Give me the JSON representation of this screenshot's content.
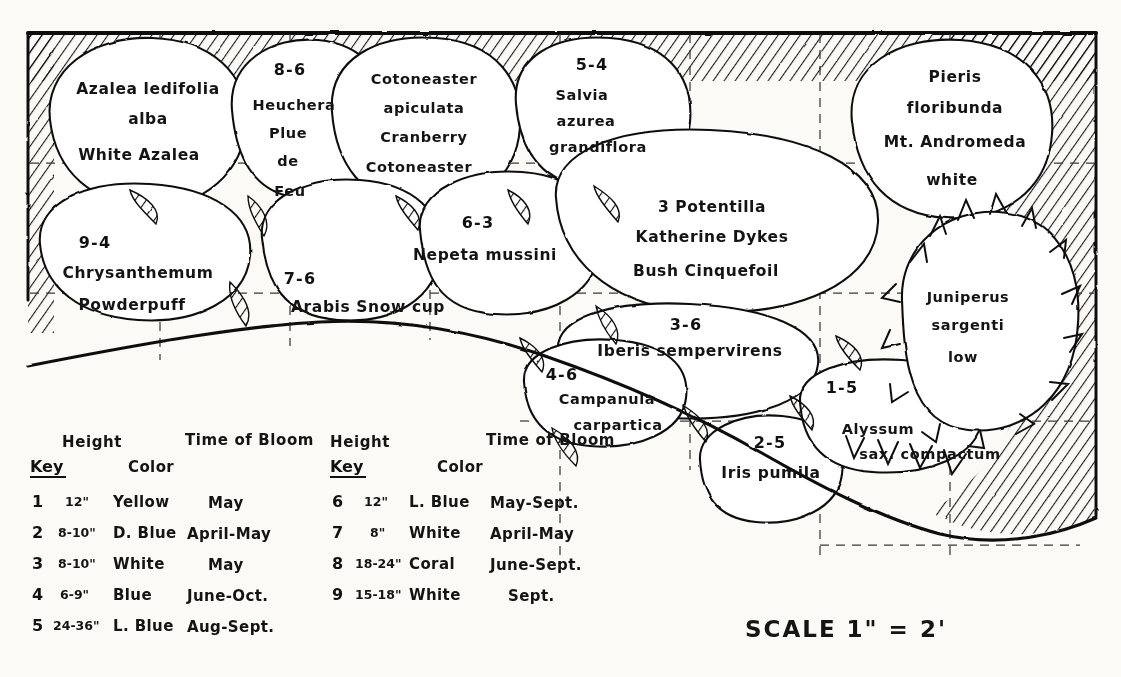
{
  "document": {
    "title": "Garden Planting Plan",
    "scale_text": "SCALE 1\" = 2'"
  },
  "plants": [
    {
      "id": "azalea",
      "key": "",
      "lines": [
        "Azalea ledifolia",
        "alba",
        "White Azalea"
      ]
    },
    {
      "id": "heuchera",
      "key": "8-6",
      "lines": [
        "Heuchera",
        "Plue",
        "de",
        "Feu"
      ]
    },
    {
      "id": "cotoneaster",
      "key": "",
      "lines": [
        "Cotoneaster",
        "apiculata",
        "Cranberry",
        "Cotoneaster"
      ]
    },
    {
      "id": "salvia",
      "key": "5-4",
      "lines": [
        "Salvia",
        "azurea",
        "grandiflora"
      ]
    },
    {
      "id": "pieris",
      "key": "",
      "lines": [
        "Pieris",
        "floribunda",
        "Mt. Andromeda",
        "white"
      ]
    },
    {
      "id": "chrysanthemum",
      "key": "9-4",
      "lines": [
        "Chrysanthemum",
        "Powderpuff"
      ]
    },
    {
      "id": "arabis",
      "key": "7-6",
      "lines": [
        "Arabis  Snow cup"
      ]
    },
    {
      "id": "nepeta",
      "key": "6-3",
      "lines": [
        "Nepeta mussini"
      ]
    },
    {
      "id": "potentilla",
      "key": "3",
      "lines": [
        "3 Potentilla",
        "Katherine Dykes",
        "Bush Cinquefoil"
      ]
    },
    {
      "id": "juniperus",
      "key": "",
      "lines": [
        "Juniperus",
        "sargenti",
        "low"
      ]
    },
    {
      "id": "iberis",
      "key": "3-6",
      "lines": [
        "Iberis sempervirens"
      ]
    },
    {
      "id": "campanula",
      "key": "4-6",
      "lines": [
        "Campanula",
        "carpartica"
      ]
    },
    {
      "id": "iris",
      "key": "2-5",
      "lines": [
        "Iris pumila"
      ]
    },
    {
      "id": "alyssum",
      "key": "1-5",
      "lines": [
        "Alyssum",
        "sax. compactum"
      ]
    }
  ],
  "legend": {
    "headers": {
      "height": "Height",
      "bloom": "Time of Bloom",
      "key": "Key",
      "color": "Color"
    },
    "left_rows": [
      {
        "key": "1",
        "height": "12\"",
        "color": "Yellow",
        "bloom": "May"
      },
      {
        "key": "2",
        "height": "8-10\"",
        "color": "D. Blue",
        "bloom": "April-May"
      },
      {
        "key": "3",
        "height": "8-10\"",
        "color": "White",
        "bloom": "May"
      },
      {
        "key": "4",
        "height": "6-9\"",
        "color": "Blue",
        "bloom": "June-Oct."
      },
      {
        "key": "5",
        "height": "24-36\"",
        "color": "L. Blue",
        "bloom": "Aug-Sept."
      }
    ],
    "right_rows": [
      {
        "key": "6",
        "height": "12\"",
        "color": "L. Blue",
        "bloom": "May-Sept."
      },
      {
        "key": "7",
        "height": "8\"",
        "color": "White",
        "bloom": "April-May"
      },
      {
        "key": "8",
        "height": "18-24\"",
        "color": "Coral",
        "bloom": "June-Sept."
      },
      {
        "key": "9",
        "height": "15-18\"",
        "color": "White",
        "bloom": "Sept."
      }
    ]
  },
  "colors": {
    "ink": "#111111",
    "paper": "#fbfaf7",
    "grid": "#3a3a3a"
  }
}
